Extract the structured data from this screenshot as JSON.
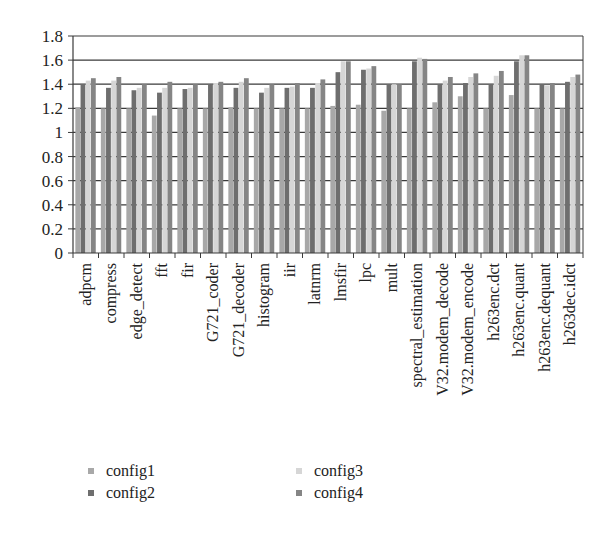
{
  "chart_data": {
    "type": "bar",
    "title": "",
    "xlabel": "",
    "ylabel": "",
    "ylim": [
      0,
      1.8
    ],
    "yticks": [
      "0",
      "0.2",
      "0.4",
      "0.6",
      "0.8",
      "1",
      "1.2",
      "1.4",
      "1.6",
      "1.8"
    ],
    "grid": true,
    "legend_position": "bottom",
    "categories": [
      "adpcm",
      "compress",
      "edge_detect",
      "fft",
      "fir",
      "G721_coder",
      "G721_decoder",
      "histogram",
      "iir",
      "latnrm",
      "lmsfir",
      "lpc",
      "mult",
      "spectral_estimation",
      "V32.modem_decode",
      "V32.modem_encode",
      "h263enc.dct",
      "h263enc.quant",
      "h263enc.dequant",
      "h263dec.idct"
    ],
    "series": [
      {
        "name": "config1",
        "color": "#a8a8a8",
        "values": [
          1.21,
          1.2,
          1.2,
          1.14,
          1.2,
          1.2,
          1.21,
          1.2,
          1.2,
          1.2,
          1.22,
          1.23,
          1.18,
          1.2,
          1.25,
          1.3,
          1.2,
          1.31,
          1.2,
          1.2
        ]
      },
      {
        "name": "config2",
        "color": "#6e6e6e",
        "values": [
          1.4,
          1.37,
          1.35,
          1.33,
          1.36,
          1.4,
          1.37,
          1.33,
          1.37,
          1.37,
          1.5,
          1.52,
          1.4,
          1.59,
          1.4,
          1.41,
          1.4,
          1.59,
          1.4,
          1.42
        ]
      },
      {
        "name": "config3",
        "color": "#d6d6d6",
        "values": [
          1.43,
          1.43,
          1.37,
          1.37,
          1.37,
          1.41,
          1.42,
          1.37,
          1.38,
          1.41,
          1.59,
          1.53,
          1.4,
          1.62,
          1.43,
          1.46,
          1.47,
          1.64,
          1.39,
          1.46
        ]
      },
      {
        "name": "config4",
        "color": "#858585",
        "values": [
          1.45,
          1.46,
          1.4,
          1.42,
          1.4,
          1.42,
          1.45,
          1.4,
          1.41,
          1.44,
          1.59,
          1.55,
          1.4,
          1.61,
          1.46,
          1.49,
          1.51,
          1.64,
          1.41,
          1.48
        ]
      }
    ]
  }
}
